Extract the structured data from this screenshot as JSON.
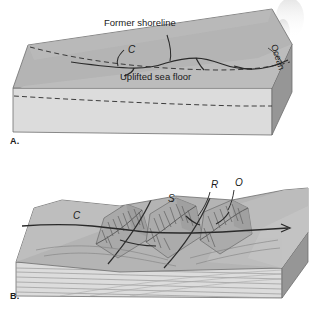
{
  "figure": {
    "kind": "geologic-block-diagram-pair",
    "palette": {
      "background": "#ffffff",
      "top_face": "#b4b4b4",
      "top_face_light": "#bfbfbf",
      "front_face": "#dcdcdc",
      "side_face": "#969696",
      "strata_line": "#8a8a8a",
      "outline": "#3a3a3a",
      "feature_line": "#2a2a2a",
      "dashed_line": "#4a4a4a",
      "text": "#1a1a1a"
    }
  },
  "panels": [
    {
      "id": "A",
      "letter": "A.",
      "description": "Block diagram of an uplifted coastal plain with a former shoreline and a smooth uplifted sea floor.",
      "labels": [
        {
          "name": "former-shoreline",
          "text": "Former shoreline",
          "style": "plain",
          "x": 104,
          "y": 26
        },
        {
          "name": "uplifted-sea-floor",
          "text": "Uplifted sea floor",
          "style": "plain",
          "x": 120,
          "y": 80
        },
        {
          "name": "coastline-c",
          "text": "C",
          "style": "italic",
          "x": 128,
          "y": 53
        },
        {
          "name": "ocean",
          "text": "Ocean",
          "style": "rotated",
          "x": 275,
          "y": 58,
          "rotation": 72
        }
      ]
    },
    {
      "id": "B",
      "letter": "B.",
      "description": "Block diagram of the same coast after erosion: ridges, subsequent streams and resequent and obsequent valleys dissect the uplifted surface.",
      "labels": [
        {
          "name": "coastline-c",
          "text": "C",
          "style": "italic",
          "x": 73,
          "y": 219
        },
        {
          "name": "subsequent-stream-s",
          "text": "S",
          "style": "italic",
          "x": 168,
          "y": 202
        },
        {
          "name": "resequent-stream-r",
          "text": "R",
          "style": "italic",
          "x": 211,
          "y": 188
        },
        {
          "name": "obsequent-stream-o",
          "text": "O",
          "style": "italic",
          "x": 235,
          "y": 186
        }
      ]
    }
  ]
}
